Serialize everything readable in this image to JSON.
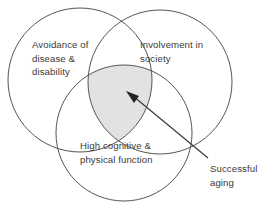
{
  "diagram": {
    "type": "venn-3-circle",
    "title_present": false,
    "background_color": "#ffffff",
    "circle_stroke_color": "#555555",
    "intersection_fill_color": "#e2e2e2",
    "text_color": "#3a3a3a",
    "pointer_color": "#222222",
    "circles": [
      {
        "id": "avoidance",
        "label": "Avoidance of\ndisease &\ndisability",
        "cx": 80,
        "cy": 80,
        "r": 72
      },
      {
        "id": "involvement",
        "label": "Involvement in\nsociety",
        "cx": 160,
        "cy": 82,
        "r": 72
      },
      {
        "id": "cognitive",
        "label": "High cognitive &\nphysical function",
        "cx": 124,
        "cy": 133,
        "r": 68
      }
    ],
    "callout": {
      "id": "successful-aging",
      "label": "Successful\naging",
      "points_to": "central-intersection",
      "line_start_x": 208,
      "line_start_y": 158,
      "line_end_x": 128,
      "line_end_y": 93
    }
  }
}
